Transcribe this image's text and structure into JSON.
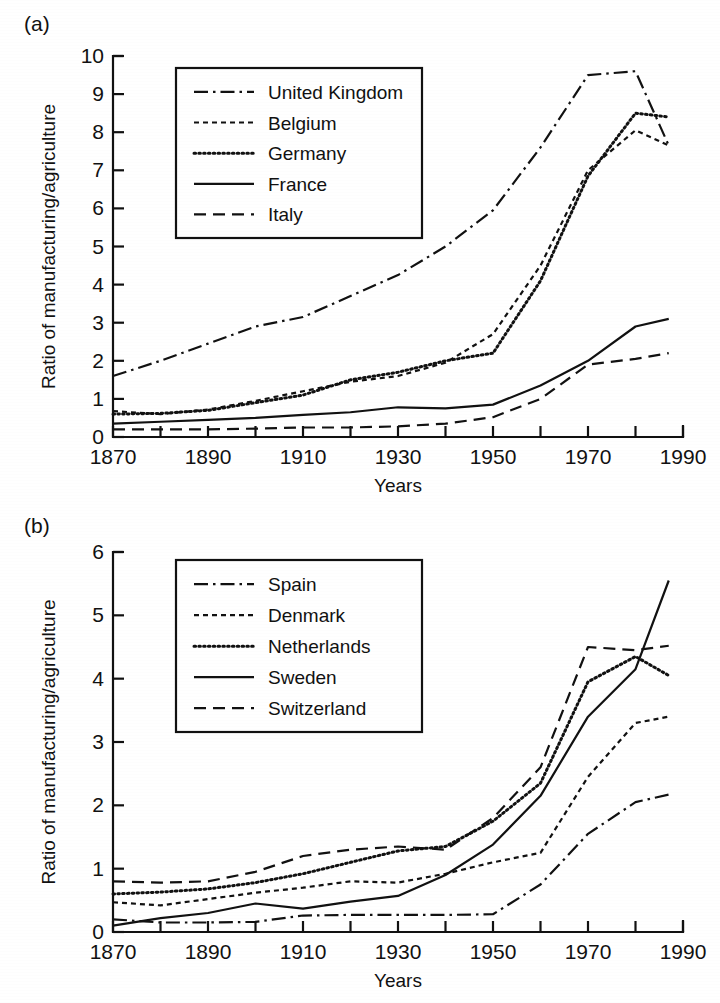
{
  "figure": {
    "background": "#ffffff",
    "ink": "#111111",
    "panels": [
      {
        "key": "a",
        "label": "(a)"
      },
      {
        "key": "b",
        "label": "(b)"
      }
    ]
  },
  "chart_data": [
    {
      "panel": "(a)",
      "type": "line",
      "title": "",
      "xlabel": "Years",
      "ylabel": "Ratio of manufacturing/agriculture",
      "xlim": [
        1870,
        1990
      ],
      "ylim": [
        0,
        10
      ],
      "xticks": [
        1870,
        1880,
        1890,
        1900,
        1910,
        1920,
        1930,
        1940,
        1950,
        1960,
        1970,
        1980,
        1990
      ],
      "xtick_labels": [
        "1870",
        "",
        "1890",
        "",
        "1910",
        "",
        "1930",
        "",
        "1950",
        "",
        "1970",
        "",
        "1990"
      ],
      "yticks": [
        0,
        1,
        2,
        3,
        4,
        5,
        6,
        7,
        8,
        9,
        10
      ],
      "ytick_labels": [
        "0",
        "1",
        "2",
        "3",
        "4",
        "5",
        "6",
        "7",
        "8",
        "9",
        "10"
      ],
      "grid": false,
      "legend_position": "upper-left-inset",
      "x": [
        1870,
        1880,
        1890,
        1900,
        1910,
        1920,
        1930,
        1940,
        1950,
        1960,
        1970,
        1980,
        1987
      ],
      "series": [
        {
          "name": "United Kingdom",
          "style": "dashdot",
          "values": [
            1.6,
            2.0,
            2.45,
            2.9,
            3.15,
            3.7,
            4.25,
            5.0,
            5.95,
            7.6,
            9.5,
            9.6,
            7.65
          ]
        },
        {
          "name": "Belgium",
          "style": "dashed-short",
          "values": [
            0.68,
            0.6,
            0.72,
            0.95,
            1.2,
            1.45,
            1.6,
            1.95,
            2.7,
            4.5,
            7.0,
            8.05,
            7.65
          ]
        },
        {
          "name": "Germany",
          "style": "dotted",
          "values": [
            0.6,
            0.62,
            0.7,
            0.9,
            1.1,
            1.5,
            1.7,
            2.0,
            2.2,
            4.1,
            6.85,
            8.5,
            8.4
          ]
        },
        {
          "name": "France",
          "style": "solid",
          "values": [
            0.35,
            0.4,
            0.45,
            0.5,
            0.58,
            0.65,
            0.78,
            0.75,
            0.85,
            1.35,
            2.0,
            2.9,
            3.1
          ]
        },
        {
          "name": "Italy",
          "style": "dashed-long",
          "values": [
            0.2,
            0.2,
            0.2,
            0.22,
            0.25,
            0.25,
            0.28,
            0.35,
            0.52,
            1.0,
            1.9,
            2.05,
            2.2
          ]
        }
      ]
    },
    {
      "panel": "(b)",
      "type": "line",
      "title": "",
      "xlabel": "Years",
      "ylabel": "Ratio of manufacturing/agriculture",
      "xlim": [
        1870,
        1990
      ],
      "ylim": [
        0,
        6
      ],
      "xticks": [
        1870,
        1880,
        1890,
        1900,
        1910,
        1920,
        1930,
        1940,
        1950,
        1960,
        1970,
        1980,
        1990
      ],
      "xtick_labels": [
        "1870",
        "",
        "1890",
        "",
        "1910",
        "",
        "1930",
        "",
        "1950",
        "",
        "1970",
        "",
        "1990"
      ],
      "yticks": [
        0,
        1,
        2,
        3,
        4,
        5,
        6
      ],
      "ytick_labels": [
        "0",
        "1",
        "2",
        "3",
        "4",
        "5",
        "6"
      ],
      "grid": false,
      "legend_position": "upper-left-inset",
      "x": [
        1870,
        1880,
        1890,
        1900,
        1910,
        1920,
        1930,
        1940,
        1950,
        1960,
        1970,
        1980,
        1987
      ],
      "series": [
        {
          "name": "Spain",
          "style": "dashdot",
          "values": [
            0.2,
            0.15,
            0.15,
            0.16,
            0.26,
            0.27,
            0.27,
            0.27,
            0.28,
            0.75,
            1.55,
            2.05,
            2.17
          ]
        },
        {
          "name": "Denmark",
          "style": "dashed-short",
          "values": [
            0.47,
            0.42,
            0.52,
            0.62,
            0.7,
            0.8,
            0.78,
            0.92,
            1.1,
            1.25,
            2.45,
            3.3,
            3.4
          ]
        },
        {
          "name": "Netherlands",
          "style": "dotted",
          "values": [
            0.6,
            0.63,
            0.68,
            0.78,
            0.92,
            1.1,
            1.28,
            1.35,
            1.75,
            2.35,
            3.95,
            4.35,
            4.05
          ]
        },
        {
          "name": "Sweden",
          "style": "solid",
          "values": [
            0.1,
            0.22,
            0.3,
            0.45,
            0.37,
            0.48,
            0.57,
            0.9,
            1.38,
            2.15,
            3.4,
            4.15,
            5.55
          ]
        },
        {
          "name": "Switzerland",
          "style": "dashed-long",
          "values": [
            0.8,
            0.78,
            0.8,
            0.95,
            1.2,
            1.3,
            1.35,
            1.3,
            1.8,
            2.6,
            4.5,
            4.45,
            4.52
          ]
        }
      ]
    }
  ]
}
